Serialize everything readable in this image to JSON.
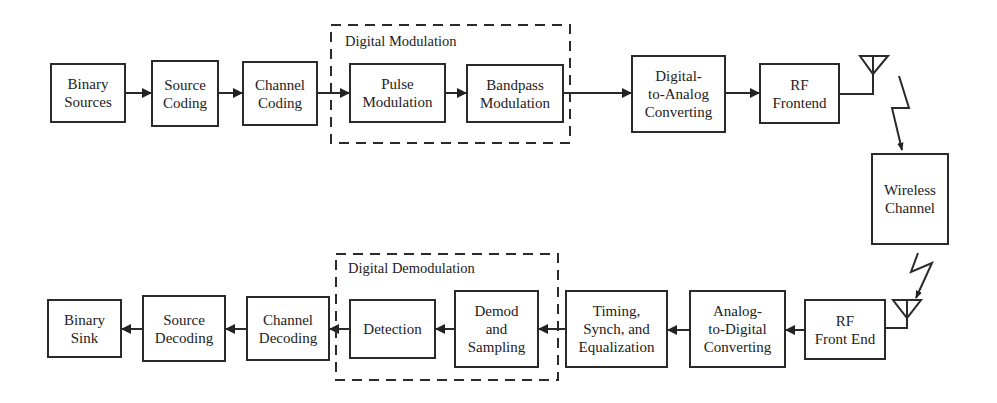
{
  "diagram": {
    "type": "block-diagram",
    "colors": {
      "stroke": "#2a2a2a",
      "background": "#ffffff"
    },
    "transmitter": {
      "blocks": [
        {
          "id": "binary-sources",
          "label": "Binary\nSources"
        },
        {
          "id": "source-coding",
          "label": "Source\nCoding"
        },
        {
          "id": "channel-coding",
          "label": "Channel\nCoding"
        },
        {
          "id": "pulse-modulation",
          "label": "Pulse\nModulation"
        },
        {
          "id": "bandpass-modulation",
          "label": "Bandpass\nModulation"
        },
        {
          "id": "digital-to-analog",
          "label": "Digital-\nto-Analog\nConverting"
        },
        {
          "id": "rf-frontend",
          "label": "RF\nFrontend"
        }
      ],
      "group_label": "Digital Modulation"
    },
    "channel": {
      "id": "wireless-channel",
      "label": "Wireless\nChannel"
    },
    "receiver": {
      "blocks": [
        {
          "id": "rf-front-end",
          "label": "RF\nFront End"
        },
        {
          "id": "analog-to-digital",
          "label": "Analog-\nto-Digital\nConverting"
        },
        {
          "id": "timing-synch-eq",
          "label": "Timing,\nSynch, and\nEqualization"
        },
        {
          "id": "demod-sampling",
          "label": "Demod\nand\nSampling"
        },
        {
          "id": "detection",
          "label": "Detection"
        },
        {
          "id": "channel-decoding",
          "label": "Channel\nDecoding"
        },
        {
          "id": "source-decoding",
          "label": "Source\nDecoding"
        },
        {
          "id": "binary-sink",
          "label": "Binary\nSink"
        }
      ],
      "group_label": "Digital Demodulation"
    },
    "flow": [
      "Binary Sources -> Source Coding -> Channel Coding -> Pulse Modulation -> Bandpass Modulation -> Digital-to-Analog Converting -> RF Frontend -> antenna -> Wireless Channel",
      "Wireless Channel -> antenna -> RF Front End -> Analog-to-Digital Converting -> Timing, Synch, and Equalization -> Demod and Sampling -> Detection -> Channel Decoding -> Source Decoding -> Binary Sink"
    ]
  }
}
